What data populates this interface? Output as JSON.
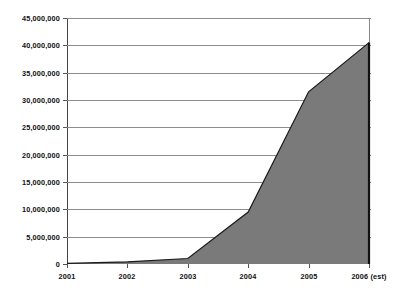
{
  "chart_data": {
    "type": "area",
    "title": "",
    "subtitle": "",
    "xlabel": "",
    "ylabel": "",
    "categories": [
      "2001",
      "2002",
      "2003",
      "2004",
      "2005",
      "2006 (est)"
    ],
    "values": [
      100000,
      400000,
      1000000,
      9500000,
      31500000,
      40500000
    ],
    "series": [
      {
        "name": "",
        "values": [
          100000,
          400000,
          1000000,
          9500000,
          31500000,
          40500000
        ]
      }
    ],
    "ylim": [
      0,
      45000000
    ],
    "ytick_labels": [
      "45,000,000",
      "40,000,000",
      "35,000,000",
      "30,000,000",
      "25,000,000",
      "20,000,000",
      "15,000,000",
      "10,000,000",
      "5,000,000",
      "0"
    ],
    "ytick_values": [
      45000000,
      40000000,
      35000000,
      30000000,
      25000000,
      20000000,
      15000000,
      10000000,
      5000000,
      0
    ],
    "grid": true,
    "legend": false,
    "legend_position": "none",
    "colors": {
      "area_fill": "#7a7a7a",
      "area_line": "#1a1a1a",
      "gridline": "#8d8d8d",
      "axis": "#111111",
      "background": "#ffffff",
      "text": "#111111"
    },
    "annotations": []
  }
}
